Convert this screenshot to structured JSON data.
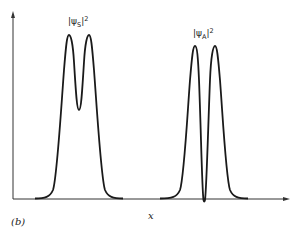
{
  "figure": {
    "panel_label": "(b)",
    "x_axis_label": "x",
    "curves": [
      {
        "id": "symmetric",
        "label_base": "|ψ",
        "label_sub": "S",
        "label_end": "|",
        "label_sup": "2",
        "description": "symmetric wavefunction probability density: two peaks joined by nonzero dip"
      },
      {
        "id": "antisymmetric",
        "label_base": "|ψ",
        "label_sub": "A",
        "label_end": "|",
        "label_sup": "2",
        "description": "antisymmetric wavefunction probability density: two peaks with zero at center"
      }
    ],
    "colors": {
      "curve": "#1a1a1a",
      "axis": "#333333",
      "background": "#ffffff"
    }
  }
}
